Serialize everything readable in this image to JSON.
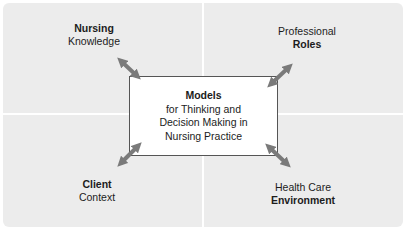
{
  "diagram": {
    "center": {
      "title": "Models",
      "lines": [
        "for Thinking and",
        "Decision Making in",
        "Nursing Practice"
      ]
    },
    "quadrants": {
      "top_left": {
        "line1": "Nursing",
        "line1_bold": true,
        "line2": "Knowledge",
        "line2_bold": false
      },
      "top_right": {
        "line1": "Professional",
        "line1_bold": false,
        "line2": "Roles",
        "line2_bold": true
      },
      "bottom_left": {
        "line1": "Client",
        "line1_bold": true,
        "line2": "Context",
        "line2_bold": false
      },
      "bottom_right": {
        "line1": "Health Care",
        "line1_bold": false,
        "line2": "Environment",
        "line2_bold": true
      }
    },
    "connectors": [
      "double-arrow-top-left",
      "double-arrow-top-right",
      "double-arrow-bottom-left",
      "double-arrow-bottom-right"
    ],
    "colors": {
      "quadrant_fill": "#ececec",
      "arrow": "#7a7a7a",
      "box_border": "#555555",
      "box_fill": "#ffffff"
    }
  }
}
